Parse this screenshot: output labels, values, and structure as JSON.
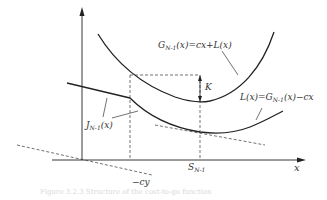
{
  "diagram": {
    "axes": {
      "x_label": "x",
      "y_label": ""
    },
    "labels": {
      "G": {
        "main": "G",
        "sub": "N-1",
        "rest": "(x)=cx+L(x)"
      },
      "L": {
        "main": "L(x)=G",
        "sub": "N-1",
        "rest": "(x)−cx"
      },
      "J": {
        "main": "J",
        "sub": "N-1",
        "rest": "(x)"
      },
      "K": "K",
      "S": {
        "main": "S",
        "sub": "N-1"
      },
      "cy": "−cy"
    },
    "curves": [
      {
        "name": "G_{N-1}(x)",
        "style": "solid",
        "description": "convex curve, minimum at S_{N-1}"
      },
      {
        "name": "L(x)",
        "style": "solid",
        "description": "convex curve below G, minimum at S_{N-1}"
      },
      {
        "name": "J_{N-1}(x)",
        "style": "solid",
        "description": "linear left piece then follows L(x)"
      },
      {
        "name": "tangent",
        "style": "dashed",
        "description": "tangent to L at S_{N-1}"
      },
      {
        "name": "-cy line",
        "style": "dashed",
        "description": "line with slope -c through origin"
      }
    ],
    "caption": "Figure 3.2.3  Structure of the cost-to-go function"
  },
  "colors": {
    "ink": "#222222",
    "label": "#333333",
    "caption": "#d8d8d8"
  }
}
